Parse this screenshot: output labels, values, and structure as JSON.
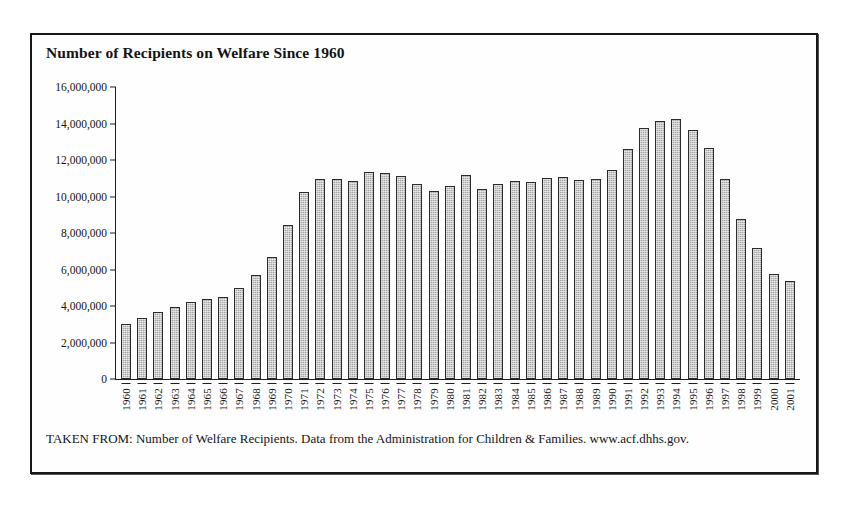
{
  "figure": {
    "title": "Number of Recipients on Welfare Since 1960",
    "source_note": "TAKEN FROM: Number of Welfare Recipients. Data from the Administration for Children & Families. www.acf.dhhs.gov.",
    "frame_color": "#17171b",
    "bar_fill_color": "#a6a6a6",
    "bar_border_color": "#2b2b2b",
    "axis_color": "#1d1d1d"
  },
  "chart_data": {
    "type": "bar",
    "title": "Number of Recipients on Welfare Since 1960",
    "xlabel": "",
    "ylabel": "",
    "ylim": [
      0,
      16000000
    ],
    "grid": false,
    "legend": "none",
    "y_ticks": [
      0,
      2000000,
      4000000,
      6000000,
      8000000,
      10000000,
      12000000,
      14000000,
      16000000
    ],
    "y_tick_labels": [
      "0",
      "2,000,000",
      "4,000,000",
      "6,000,000",
      "8,000,000",
      "10,000,000",
      "12,000,000",
      "14,000,000",
      "16,000,000"
    ],
    "categories": [
      "1960",
      "1961",
      "1962",
      "1963",
      "1964",
      "1965",
      "1966",
      "1967",
      "1968",
      "1969",
      "1970",
      "1971",
      "1972",
      "1973",
      "1974",
      "1975",
      "1976",
      "1977",
      "1978",
      "1979",
      "1980",
      "1981",
      "1982",
      "1983",
      "1984",
      "1985",
      "1986",
      "1987",
      "1988",
      "1989",
      "1990",
      "1991",
      "1992",
      "1993",
      "1994",
      "1995",
      "1996",
      "1997",
      "1998",
      "1999",
      "2000",
      "2001"
    ],
    "values": [
      3005000,
      3354000,
      3676000,
      3930000,
      4219000,
      4396000,
      4513000,
      5014000,
      5705000,
      6706000,
      8466000,
      10241000,
      10947000,
      10949000,
      10864000,
      11346000,
      11304000,
      11130000,
      10672000,
      10318000,
      10597000,
      11160000,
      10431000,
      10659000,
      10866000,
      10813000,
      10993000,
      11065000,
      10920000,
      10935000,
      11460000,
      12595000,
      13773000,
      14143000,
      14226000,
      13652000,
      12645000,
      10935000,
      8770000,
      7188000,
      5781000,
      5359000
    ]
  }
}
